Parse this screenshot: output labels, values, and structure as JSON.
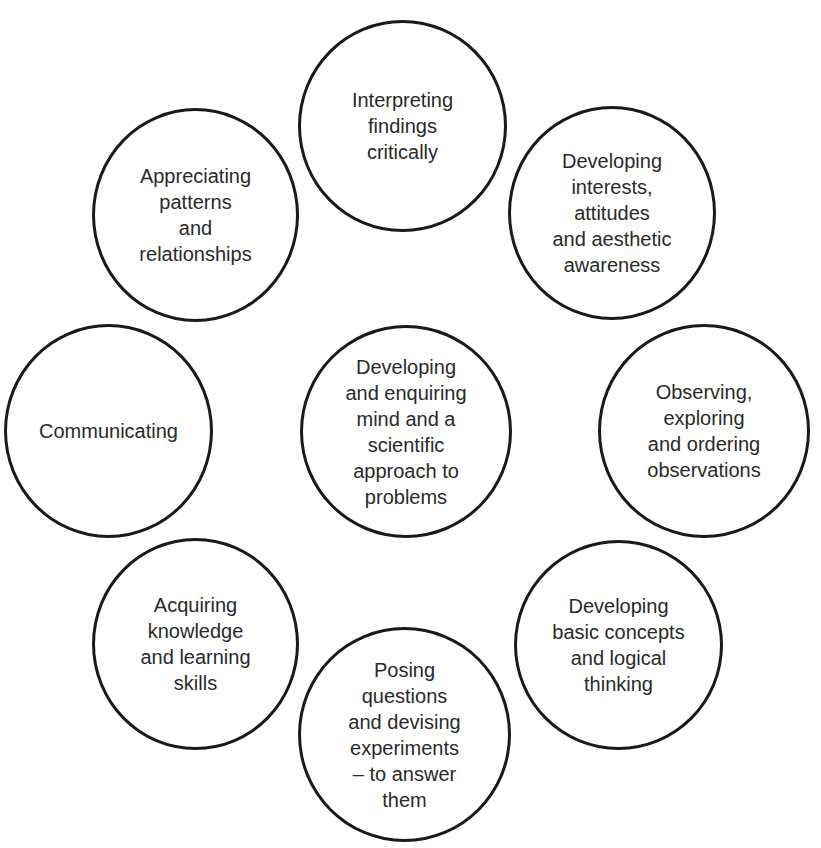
{
  "diagram": {
    "center": {
      "label": "Developing\nand enquiring\nmind and a\nscientific\napproach to\nproblems"
    },
    "nodes": [
      {
        "id": "interpreting",
        "label": "Interpreting\nfindings\ncritically"
      },
      {
        "id": "interests",
        "label": "Developing\ninterests,\nattitudes\nand aesthetic\nawareness"
      },
      {
        "id": "observing",
        "label": "Observing,\nexploring\nand ordering\nobservations"
      },
      {
        "id": "concepts",
        "label": "Developing\nbasic concepts\nand logical\nthinking"
      },
      {
        "id": "posing",
        "label": "Posing\nquestions\nand devising\nexperiments\n– to answer\nthem"
      },
      {
        "id": "acquiring",
        "label": "Acquiring\nknowledge\nand learning\nskills"
      },
      {
        "id": "communicating",
        "label": "Communicating"
      },
      {
        "id": "appreciating",
        "label": "Appreciating\npatterns\nand\nrelationships"
      }
    ],
    "colors": {
      "stroke": "#1a1a1a",
      "text": "#2a2a2a",
      "background": "#ffffff"
    }
  }
}
